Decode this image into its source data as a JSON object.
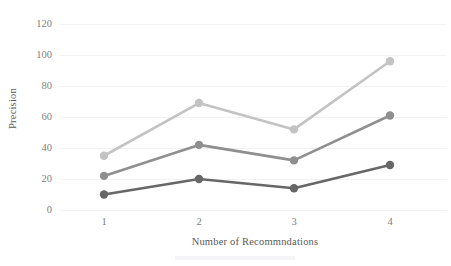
{
  "chart_data": {
    "type": "line",
    "title": "",
    "xlabel": "Number of Recommndations",
    "ylabel": "Precision",
    "categories": [
      "1",
      "2",
      "3",
      "4"
    ],
    "x": [
      1,
      2,
      3,
      4
    ],
    "xlim": [
      0.5,
      4.5
    ],
    "ylim": [
      0,
      120
    ],
    "yticks": [
      0,
      20,
      40,
      60,
      80,
      100,
      120
    ],
    "ytick_labels": [
      "0",
      "20",
      "40",
      "60",
      "80",
      "100",
      "120"
    ],
    "xtick_labels": [
      "1",
      "2",
      "3",
      "4"
    ],
    "grid": "horizontal",
    "legend": "none",
    "series": [
      {
        "name": "series-light",
        "color": "#c3c3c3",
        "marker": "circle",
        "values": [
          35,
          69,
          52,
          96
        ]
      },
      {
        "name": "series-medium",
        "color": "#8f8f8f",
        "marker": "circle",
        "values": [
          22,
          42,
          32,
          61
        ]
      },
      {
        "name": "series-dark",
        "color": "#676767",
        "marker": "circle",
        "values": [
          10,
          20,
          14,
          29
        ]
      }
    ]
  },
  "axes": {
    "y_title": "Precision",
    "x_title": "Number of Recommndations"
  },
  "ytick_labels": {
    "t0": "0",
    "t1": "20",
    "t2": "40",
    "t3": "60",
    "t4": "80",
    "t5": "100",
    "t6": "120"
  },
  "xtick_labels": {
    "t0": "1",
    "t1": "2",
    "t2": "3",
    "t3": "4"
  },
  "colors": {
    "grid": "#f2f2f2",
    "tick_text": "#7f7f7f",
    "title_text": "#595959",
    "series_light": "#c3c3c3",
    "series_medium": "#8f8f8f",
    "series_dark": "#676767",
    "background": "#ffffff"
  }
}
